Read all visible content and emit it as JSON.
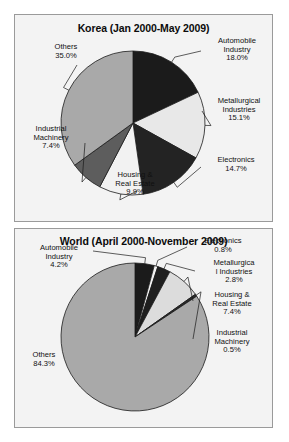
{
  "figure": {
    "background": "#ffffff",
    "panel_background": "#f3f3f3",
    "panel_border": "#9a9a9a"
  },
  "charts": [
    {
      "id": "korea",
      "title": "Korea (Jan 2000-May 2009)",
      "type": "pie",
      "start_angle_deg": 0,
      "direction": "clockwise",
      "labels": [
        "Automobile\nIndustry\n18.0%",
        "Metallurgical\nIndustries\n15.1%",
        "Electronics\n14.7%",
        "Housing &\nReal Estate\n9.9%",
        "Industrial\nMachinery\n7.4%",
        "Others\n35.0%"
      ],
      "categories": [
        "Automobile Industry",
        "Metallurgical Industries",
        "Electronics",
        "Housing & Real Estate",
        "Industrial Machinery",
        "Others"
      ],
      "values": [
        18.0,
        15.1,
        14.7,
        9.9,
        7.4,
        35.0
      ],
      "value_text": [
        "18.0%",
        "15.1%",
        "14.7%",
        "9.9%",
        "7.4%",
        "35.0%"
      ],
      "colors": [
        "#1b1b1b",
        "#e8e8e8",
        "#232323",
        "#f2f2f2",
        "#5d5d5d",
        "#a9a9a9"
      ]
    },
    {
      "id": "world",
      "title": "World (April 2000-November 2009)",
      "type": "pie",
      "start_angle_deg": 0,
      "direction": "clockwise",
      "labels": [
        "Automobile\nIndustry\n4.2%",
        "Electronics\n0.8%",
        "Metallurgica\nl Industries\n2.8%",
        "Housing &\nReal Estate\n7.4%",
        "Industrial\nMachinery\n0.5%",
        "Others\n84.3%"
      ],
      "categories": [
        "Automobile Industry",
        "Electronics",
        "Metallurgical Industries",
        "Housing & Real Estate",
        "Industrial Machinery",
        "Others"
      ],
      "values": [
        4.2,
        0.8,
        2.8,
        7.4,
        0.5,
        84.3
      ],
      "value_text": [
        "4.2%",
        "0.8%",
        "2.8%",
        "7.4%",
        "0.5%",
        "84.3%"
      ],
      "colors": [
        "#1b1b1b",
        "#f2f2f2",
        "#1f1f1f",
        "#dcdcdc",
        "#2a2a2a",
        "#a9a9a9"
      ]
    }
  ],
  "chart_data": [
    {
      "type": "pie",
      "title": "Korea (Jan 2000-May 2009)",
      "xlabel": "",
      "ylabel": "",
      "legend": "none (direct slice labels with leader lines)",
      "grid": false,
      "units": "percent",
      "categories": [
        "Automobile Industry",
        "Metallurgical Industries",
        "Electronics",
        "Housing & Real Estate",
        "Industrial Machinery",
        "Others"
      ],
      "values": [
        18.0,
        15.1,
        14.7,
        9.9,
        7.4,
        35.0
      ],
      "total": 100.1,
      "slice_order": "clockwise from 12 o'clock",
      "annotations": [
        "Automobile Industry 18.0%",
        "Metallurgical Industries 15.1%",
        "Electronics 14.7%",
        "Housing & Real Estate 9.9%",
        "Industrial Machinery 7.4%",
        "Others 35.0%"
      ]
    },
    {
      "type": "pie",
      "title": "World (April 2000-November 2009)",
      "xlabel": "",
      "ylabel": "",
      "legend": "none (direct slice labels with leader lines)",
      "grid": false,
      "units": "percent",
      "categories": [
        "Automobile Industry",
        "Electronics",
        "Metallurgical Industries",
        "Housing & Real Estate",
        "Industrial Machinery",
        "Others"
      ],
      "values": [
        4.2,
        0.8,
        2.8,
        7.4,
        0.5,
        84.3
      ],
      "total": 100.0,
      "slice_order": "clockwise from 12 o'clock",
      "annotations": [
        "Automobile Industry 4.2%",
        "Electronics 0.8%",
        "Metallurgica l Industries 2.8%",
        "Housing & Real Estate 7.4%",
        "Industrial Machinery 0.5%",
        "Others 84.3%"
      ]
    }
  ],
  "korea_label_pos": [
    {
      "left": 185,
      "top": 22,
      "width": 74
    },
    {
      "left": 188,
      "top": 82,
      "width": 72
    },
    {
      "left": 186,
      "top": 141,
      "width": 70
    },
    {
      "left": 82,
      "top": 156,
      "width": 76
    },
    {
      "left": 2,
      "top": 110,
      "width": 68
    },
    {
      "left": 22,
      "top": 28,
      "width": 58
    }
  ],
  "world_label_pos": [
    {
      "left": 8,
      "top": 15,
      "width": 72
    },
    {
      "left": 170,
      "top": 8,
      "width": 76
    },
    {
      "left": 182,
      "top": 30,
      "width": 74
    },
    {
      "left": 180,
      "top": 62,
      "width": 74
    },
    {
      "left": 180,
      "top": 100,
      "width": 74
    },
    {
      "left": 2,
      "top": 122,
      "width": 54
    }
  ]
}
